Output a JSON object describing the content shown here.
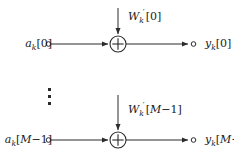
{
  "figure": {
    "type": "signal-flow-diagram",
    "background_color": "#ffffff",
    "stroke_color": "#2b2b2b",
    "text_color": "#1a1a1a",
    "ellipsis_glyph": "vertical-ellipsis"
  },
  "rows": {
    "top": {
      "input_label": {
        "base": "a",
        "sub": "k",
        "index": "[0]",
        "full": "a_k[0]"
      },
      "weight_label": {
        "base": "W",
        "sub": "k",
        "prime": "′",
        "index": "[0]",
        "full": "W'_k[0]"
      },
      "output_label": {
        "base": "y",
        "sub": "k",
        "index": "[0]",
        "full": "y_k[0]"
      },
      "operator": "+"
    },
    "bottom": {
      "input_label": {
        "base": "a",
        "sub": "k",
        "index_open": "[",
        "index_cal": "M",
        "index_rest": "−1]",
        "full": "a_k[M-1]"
      },
      "weight_label": {
        "base": "W",
        "sub": "k",
        "prime": "′",
        "index_open": "[",
        "index_cal": "M",
        "index_rest": "−1]",
        "full": "W'_k[M-1]"
      },
      "output_label": {
        "base": "y",
        "sub": "k",
        "index_open": "[",
        "index_cal": "M",
        "index_rest": "−1]",
        "full": "y_k[M-1]"
      },
      "operator": "+"
    }
  }
}
